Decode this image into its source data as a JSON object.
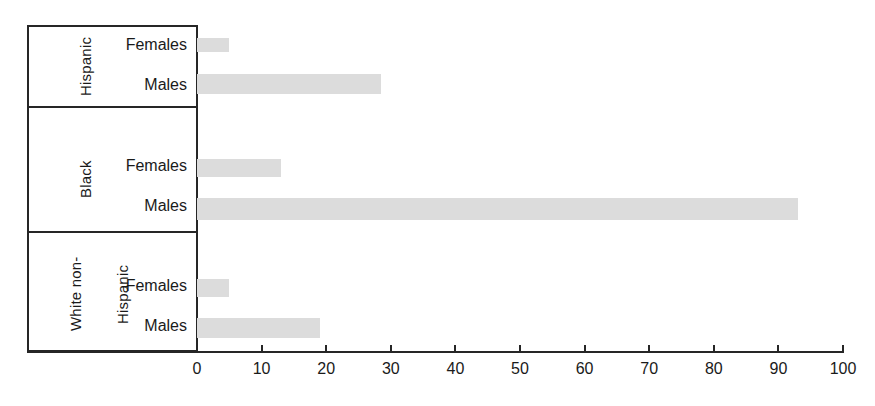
{
  "chart_data": {
    "type": "bar",
    "orientation": "horizontal",
    "title": "",
    "subtitle": "",
    "xlabel": "",
    "ylabel": "",
    "xlim": [
      0,
      100
    ],
    "xticks": [
      0,
      10,
      20,
      30,
      40,
      50,
      60,
      70,
      80,
      90,
      100
    ],
    "xtick_labels": [
      "0",
      "10",
      "20",
      "30",
      "40",
      "50",
      "60",
      "70",
      "80",
      "90",
      "100"
    ],
    "grid": false,
    "legend": "none",
    "bar_color": "#dcdcdc",
    "axis_color": "#262626",
    "groups": [
      {
        "name": "Hispanic",
        "name_lines": [
          "Hispanic"
        ],
        "categories": [
          "Females",
          "Males"
        ],
        "values": [
          5,
          28.5
        ]
      },
      {
        "name": "Black",
        "name_lines": [
          "Black"
        ],
        "categories": [
          "Females",
          "Males"
        ],
        "values": [
          13,
          93
        ]
      },
      {
        "name": "White non-Hispanic",
        "name_lines": [
          "White non-",
          "Hispanic"
        ],
        "categories": [
          "Females",
          "Males"
        ],
        "values": [
          5,
          19
        ]
      }
    ],
    "categories": [
      "Females",
      "Males"
    ],
    "series": [
      {
        "name": "Hispanic",
        "values": [
          5,
          28.5
        ]
      },
      {
        "name": "Black",
        "values": [
          13,
          93
        ]
      },
      {
        "name": "White non-Hispanic",
        "values": [
          5,
          19
        ]
      }
    ]
  },
  "bars": [
    {
      "group": "Hispanic",
      "sex": "Females",
      "value": 5,
      "top": 38,
      "height": 14
    },
    {
      "group": "Hispanic",
      "sex": "Males",
      "value": 28.5,
      "top": 74,
      "height": 20
    },
    {
      "group": "Black",
      "sex": "Females",
      "value": 13,
      "top": 159,
      "height": 18
    },
    {
      "group": "Black",
      "sex": "Males",
      "value": 93,
      "top": 198,
      "height": 22
    },
    {
      "group": "White non-Hispanic",
      "sex": "Females",
      "value": 5,
      "top": 279,
      "height": 18
    },
    {
      "group": "White non-Hispanic",
      "sex": "Males",
      "value": 19,
      "top": 318,
      "height": 20
    }
  ],
  "sex_labels": [
    {
      "text": "Females",
      "top": 36
    },
    {
      "text": "Males",
      "top": 76
    },
    {
      "text": "Females",
      "top": 157
    },
    {
      "text": "Males",
      "top": 197
    },
    {
      "text": "Females",
      "top": 277
    },
    {
      "text": "Males",
      "top": 317
    }
  ]
}
